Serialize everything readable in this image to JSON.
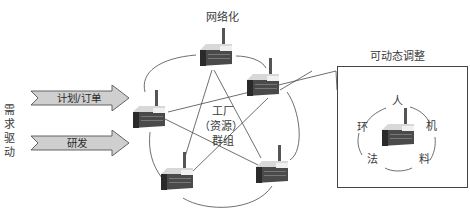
{
  "diagram": {
    "top_label": "网络化",
    "center_label": {
      "line1": "工厂",
      "line2": "（资源）",
      "line3": "群组"
    },
    "left_vertical_label": [
      "需",
      "求",
      "驱",
      "动"
    ],
    "arrows": [
      {
        "label": "计划/订单"
      },
      {
        "label": "研发"
      }
    ],
    "detail_box": {
      "title": "可动态调整",
      "factors": {
        "top": "人",
        "right": "机",
        "bottom_right": "料",
        "bottom_left": "法",
        "left": "环"
      }
    },
    "icons": {
      "factory": "factory-icon",
      "arrow": "chevron-arrow-icon"
    },
    "colors": {
      "arrow_fill": "#cfcfcf",
      "arrow_stroke": "#555555",
      "line": "#4a4a4a",
      "factory_dark": "#3c3c3c",
      "factory_light": "#e6e6e6"
    }
  }
}
